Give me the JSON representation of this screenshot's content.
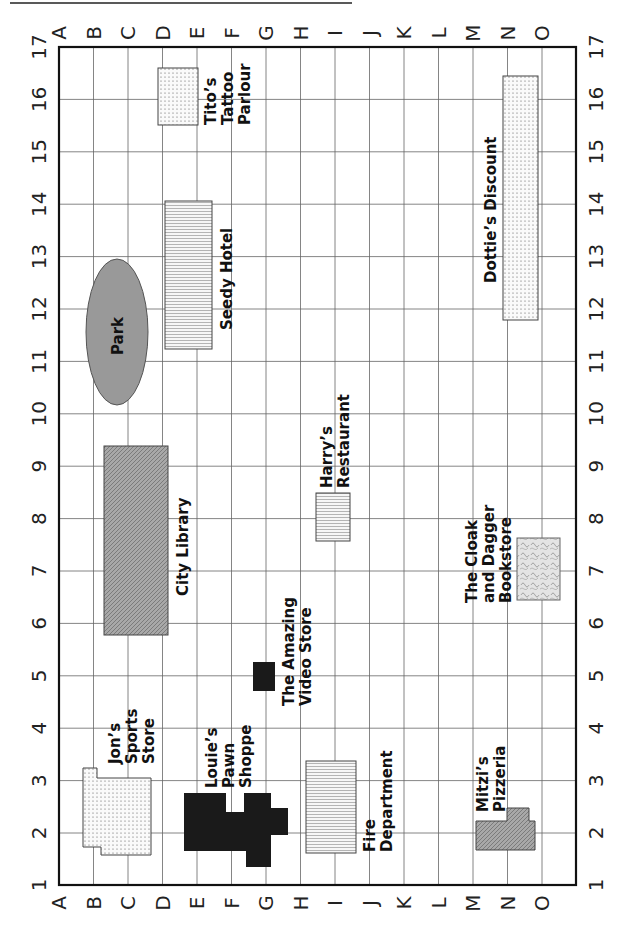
{
  "map": {
    "columns": [
      "A",
      "B",
      "C",
      "D",
      "E",
      "F",
      "G",
      "H",
      "I",
      "J",
      "K",
      "L",
      "M",
      "N",
      "O"
    ],
    "rows": [
      "1",
      "2",
      "3",
      "4",
      "5",
      "6",
      "7",
      "8",
      "9",
      "10",
      "11",
      "12",
      "13",
      "14",
      "15",
      "16",
      "17"
    ],
    "colors": {
      "grid": "#555555",
      "border": "#111111",
      "dark_fill": "#1a1a1a",
      "gray_fill": "#9a9a9a",
      "light_fill": "#f4f4f4"
    }
  },
  "locations": [
    {
      "id": "titos",
      "label_lines": [
        "Tito’s",
        "Tattoo",
        "Parlour"
      ],
      "pattern": "dots"
    },
    {
      "id": "seedy",
      "label_lines": [
        "Seedy Hotel"
      ],
      "pattern": "hlines"
    },
    {
      "id": "park",
      "label_lines": [
        "Park"
      ],
      "pattern": "gray"
    },
    {
      "id": "library",
      "label_lines": [
        "City Library"
      ],
      "pattern": "diag"
    },
    {
      "id": "video",
      "label_lines": [
        "The Amazing",
        "Video Store"
      ],
      "pattern": "solid"
    },
    {
      "id": "dotties",
      "label_lines": [
        "Dottie’s Discount"
      ],
      "pattern": "dots"
    },
    {
      "id": "harrys",
      "label_lines": [
        "Harry’s",
        "Restaurant"
      ],
      "pattern": "hlines"
    },
    {
      "id": "bookstore",
      "label_lines": [
        "The Cloak",
        "and Dagger",
        "Bookstore"
      ],
      "pattern": "swirl"
    },
    {
      "id": "jons",
      "label_lines": [
        "Jon’s",
        "Sports",
        "Store"
      ],
      "pattern": "dots"
    },
    {
      "id": "louies",
      "label_lines": [
        "Louie’s",
        "Pawn",
        "Shoppe"
      ],
      "pattern": "solid"
    },
    {
      "id": "fire",
      "label_lines": [
        "Fire",
        "Department"
      ],
      "pattern": "hlines"
    },
    {
      "id": "mitzis",
      "label_lines": [
        "Mitzi’s",
        "Pizzeria"
      ],
      "pattern": "diag"
    }
  ]
}
